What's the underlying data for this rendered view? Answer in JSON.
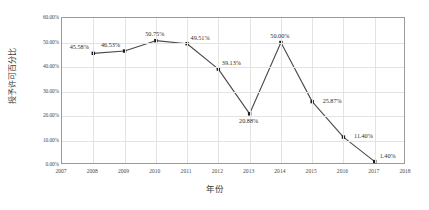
{
  "chart_data": {
    "type": "line",
    "title": "",
    "xlabel": "年份",
    "ylabel": "授予许可百分比",
    "xlim": [
      2007,
      2018
    ],
    "ylim": [
      0,
      0.6
    ],
    "grid": true,
    "legend": false,
    "x": [
      2008,
      2009,
      2010,
      2011,
      2012,
      2013,
      2014,
      2015,
      2016,
      2017
    ],
    "values": [
      45.58,
      46.53,
      50.75,
      49.51,
      39.13,
      20.88,
      50.0,
      25.87,
      11.4,
      1.4
    ],
    "point_labels": [
      "45.58%",
      "46.53%",
      "50.75%",
      "49.51%",
      "39.13%",
      "20.88%",
      "50.00%",
      "25.87%",
      "11.40%",
      "1.40%"
    ],
    "label_positions": [
      "above-left",
      "above-left",
      "above",
      "above-right",
      "above-right",
      "below",
      "above",
      "right",
      "right",
      "above-right"
    ],
    "xticks": [
      "2007",
      "2008",
      "2009",
      "2010",
      "2011",
      "2012",
      "2013",
      "2014",
      "2015",
      "2016",
      "2017",
      "2018"
    ],
    "xtick_values": [
      2007,
      2008,
      2009,
      2010,
      2011,
      2012,
      2013,
      2014,
      2015,
      2016,
      2017,
      2018
    ],
    "yticks": [
      "0.00%",
      "10.00%",
      "20.00%",
      "30.00%",
      "40.00%",
      "50.00%",
      "60.00%"
    ],
    "ytick_values": [
      0,
      10,
      20,
      30,
      40,
      50,
      60
    ],
    "series_color": "#4a4a4a",
    "marker_color": "#1c1c1c",
    "grid_color": "#e3e3e3",
    "axis_color": "#9a9a9a",
    "background_color": "#ffffff"
  }
}
